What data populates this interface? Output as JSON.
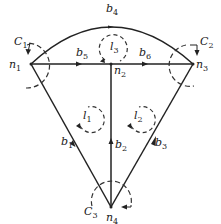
{
  "diagram": {
    "nodes": [
      {
        "id": "n1",
        "label": "n",
        "sub": "1",
        "x": 31,
        "y": 64
      },
      {
        "id": "n2",
        "label": "n",
        "sub": "2",
        "x": 111,
        "y": 64
      },
      {
        "id": "n3",
        "label": "n",
        "sub": "3",
        "x": 193,
        "y": 64
      },
      {
        "id": "n4",
        "label": "n",
        "sub": "4",
        "x": 111,
        "y": 207
      }
    ],
    "branches": [
      {
        "id": "b1",
        "label": "b",
        "sub": "1",
        "from": "n4",
        "to": "n1"
      },
      {
        "id": "b2",
        "label": "b",
        "sub": "2",
        "from": "n4",
        "to": "n2"
      },
      {
        "id": "b3",
        "label": "b",
        "sub": "3",
        "from": "n4",
        "to": "n3"
      },
      {
        "id": "b4",
        "label": "b",
        "sub": "4",
        "from": "n1",
        "to": "n3",
        "shape": "arc"
      },
      {
        "id": "b5",
        "label": "b",
        "sub": "5",
        "from": "n1",
        "to": "n2"
      },
      {
        "id": "b6",
        "label": "b",
        "sub": "6",
        "from": "n2",
        "to": "n3"
      }
    ],
    "loops": [
      {
        "id": "l1",
        "label": "l",
        "sub": "1"
      },
      {
        "id": "l2",
        "label": "l",
        "sub": "2"
      },
      {
        "id": "l3",
        "label": "l",
        "sub": "3"
      }
    ],
    "cutsets": [
      {
        "id": "C1",
        "label": "C",
        "sub": "1"
      },
      {
        "id": "C2",
        "label": "C",
        "sub": "2"
      },
      {
        "id": "C3",
        "label": "C",
        "sub": "3"
      }
    ],
    "colors": {
      "line": "#222222",
      "dashed": "#333333"
    }
  }
}
